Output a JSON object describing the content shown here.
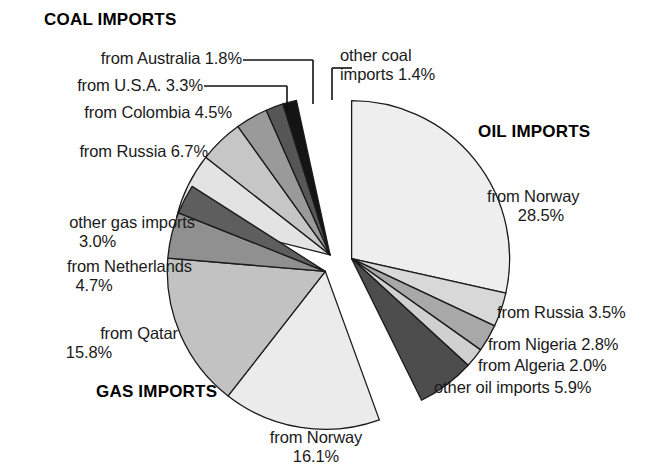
{
  "chart_data": {
    "type": "pie",
    "title": "",
    "groups": [
      {
        "name": "COAL IMPORTS",
        "total": 17.7,
        "slices": [
          {
            "label": "from Russia 6.7%",
            "country": "from Russia",
            "value": 6.7,
            "color": "#e3e3e3"
          },
          {
            "label": "from Colombia 4.5%",
            "country": "from Colombia",
            "value": 4.5,
            "color": "#c6c6c6"
          },
          {
            "label": "from U.S.A. 3.3%",
            "country": "from U.S.A.",
            "value": 3.3,
            "color": "#9a9a9a"
          },
          {
            "label": "from Australia 1.8%",
            "country": "from Australia",
            "value": 1.8,
            "color": "#565656"
          },
          {
            "label": "other coal imports 1.4%",
            "country": "other coal imports",
            "value": 1.4,
            "color": "#141414"
          }
        ]
      },
      {
        "name": "OIL IMPORTS",
        "total": 42.7,
        "slices": [
          {
            "label": "from Norway 28.5%",
            "country": "from Norway",
            "value": 28.5,
            "color": "#eeeeee"
          },
          {
            "label": "from Russia 3.5%",
            "country": "from Russia",
            "value": 3.5,
            "color": "#d8d8d8"
          },
          {
            "label": "from Nigeria 2.8%",
            "country": "from Nigeria",
            "value": 2.8,
            "color": "#a8a8a8"
          },
          {
            "label": "from Algeria 2.0%",
            "country": "from Algeria",
            "value": 2.0,
            "color": "#d0d0d0"
          },
          {
            "label": "other oil imports 5.9%",
            "country": "other oil imports",
            "value": 5.9,
            "color": "#4d4d4d"
          }
        ]
      },
      {
        "name": "GAS IMPORTS",
        "total": 39.6,
        "slices": [
          {
            "label": "from Norway 16.1%",
            "country": "from Norway",
            "value": 16.1,
            "color": "#ebebeb"
          },
          {
            "label": "from Qatar 15.8%",
            "country": "from Qatar",
            "value": 15.8,
            "color": "#c2c2c2"
          },
          {
            "label": "from Netherlands 4.7%",
            "country": "from Netherlands",
            "value": 4.7,
            "color": "#909090"
          },
          {
            "label": "other gas imports 3.0%",
            "country": "other gas imports",
            "value": 3.0,
            "color": "#5e5e5e"
          }
        ]
      }
    ],
    "legend_position": "callout-labels",
    "grid": false
  },
  "headers": {
    "coal": "COAL IMPORTS",
    "oil": "OIL IMPORTS",
    "gas": "GAS IMPORTS"
  },
  "labels": {
    "coal_australia": "from Australia 1.8%",
    "coal_usa": "from U.S.A. 3.3%",
    "coal_colombia": "from Colombia 4.5%",
    "coal_russia": "from Russia 6.7%",
    "coal_other_l1": "other coal",
    "coal_other_l2": "imports 1.4%",
    "oil_norway_l1": "from Norway",
    "oil_norway_l2": "28.5%",
    "oil_russia": "from Russia 3.5%",
    "oil_nigeria": "from Nigeria 2.8%",
    "oil_algeria": "from Algeria 2.0%",
    "oil_other": "other oil imports 5.9%",
    "gas_other_l1": "other gas imports",
    "gas_other_l2": "3.0%",
    "gas_netherlands_l1": "from Netherlands",
    "gas_netherlands_l2": "4.7%",
    "gas_qatar_l1": "from Qatar",
    "gas_qatar_l2": "15.8%",
    "gas_norway_l1": "from Norway",
    "gas_norway_l2": "16.1%"
  }
}
